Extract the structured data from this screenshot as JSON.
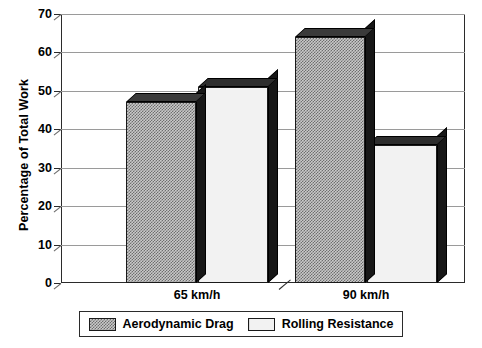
{
  "chart_data": {
    "type": "bar",
    "title": "",
    "xlabel": "",
    "ylabel": "Percentage of Total Work",
    "categories": [
      "65 km/h",
      "90 km/h"
    ],
    "series": [
      {
        "name": "Aerodynamic Drag",
        "values": [
          47,
          64
        ],
        "fill": "checkerboard",
        "color": "#8a8a8a"
      },
      {
        "name": "Rolling Resistance",
        "values": [
          51,
          36
        ],
        "fill": "light-vertical-hatch",
        "color": "#f2f2f2"
      }
    ],
    "ylim": [
      0,
      70
    ],
    "ytick_values": [
      0,
      10,
      20,
      30,
      40,
      50,
      60,
      70
    ],
    "ytick_labels": [
      "0",
      "10",
      "20",
      "30",
      "40",
      "50",
      "60",
      "70"
    ],
    "grid": true,
    "grid_axis": "y",
    "legend_position": "below",
    "style": "3d-extruded-bars",
    "axis_break_between_groups": true,
    "annotations": []
  },
  "legend": {
    "items": [
      {
        "label": "Aerodynamic Drag",
        "swatch": "checkerboard-swatch"
      },
      {
        "label": "Rolling Resistance",
        "swatch": "light-swatch"
      }
    ]
  },
  "colors": {
    "axis": "#2b2b2b",
    "gridline": "#9a9a9a",
    "bar_drag": "#8a8a8a",
    "bar_roll": "#f2f2f2",
    "bar_depth": "#171717",
    "background": "#ffffff"
  }
}
